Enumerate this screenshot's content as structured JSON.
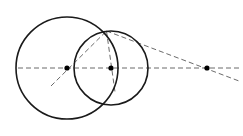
{
  "figure": {
    "canvas": {
      "width": 243,
      "height": 136,
      "background": "#ffffff"
    },
    "stroke_colors": {
      "circle": "#1a1a1a",
      "dashed": "#6b6b6b",
      "point": "#000000"
    },
    "stroke_widths": {
      "circle": 1.6,
      "dashed": 1.0
    },
    "dash_pattern": "5,3"
  },
  "circles": [
    {
      "name": "large-circle",
      "label": "Large circle",
      "cx": 67,
      "cy": 68,
      "r": 51,
      "stroke": "#1a1a1a",
      "stroke_width": 1.6
    },
    {
      "name": "small-circle",
      "label": "Small circle",
      "cx": 111,
      "cy": 68,
      "r": 37,
      "stroke": "#1a1a1a",
      "stroke_width": 1.6
    }
  ],
  "points": [
    {
      "name": "left-center-point",
      "label": "Center of large circle",
      "x": 67,
      "y": 68,
      "r": 2.6,
      "fill": "#000000"
    },
    {
      "name": "middle-center-point",
      "label": "Center of small circle",
      "x": 111,
      "y": 68,
      "r": 2.6,
      "fill": "#000000"
    },
    {
      "name": "right-external-point",
      "label": "External point on axis",
      "x": 207,
      "y": 68,
      "r": 2.6,
      "fill": "#000000"
    }
  ],
  "intersection": {
    "name": "upper-intersection-point",
    "label": "Upper intersection of circles",
    "x": 106.5,
    "y": 31.0
  },
  "dashed_lines": [
    {
      "name": "horizontal-axis-line",
      "label": "Horizontal center axis",
      "x1": 18,
      "y1": 68,
      "x2": 239,
      "y2": 68
    },
    {
      "name": "radius-line-left-center-to-intersection",
      "label": "Radius from large circle center to intersection",
      "x1": 51,
      "y1": 86,
      "x2": 106.5,
      "y2": 31
    },
    {
      "name": "radius-line-middle-center-to-intersection",
      "label": "Radius from small circle center to intersection",
      "x1": 106.5,
      "y1": 31,
      "x2": 115,
      "y2": 92
    },
    {
      "name": "tangent-line-intersection-to-external-point",
      "label": "Tangent line from intersection through external point",
      "x1": 106.5,
      "y1": 31,
      "x2": 239,
      "y2": 81
    }
  ],
  "accessibility": {
    "description": "A geometric diagram: a large circle on the left overlapping a smaller circle on the right. A dashed horizontal line passes through both centers and continues to a third marked point far to the right. Dashed segments connect the upper intersection point of the two circles to each center and extend outward to the right-hand point."
  }
}
